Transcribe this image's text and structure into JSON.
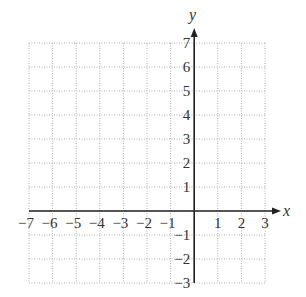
{
  "chart_data": {
    "type": "scatter",
    "title": "",
    "xlabel": "x",
    "ylabel": "y",
    "xlim": [
      -7,
      3
    ],
    "ylim": [
      -3,
      7
    ],
    "grid": true,
    "grid_style": "dotted",
    "x_ticks": [
      -7,
      -6,
      -5,
      -4,
      -3,
      -2,
      -1,
      1,
      2,
      3
    ],
    "y_ticks": [
      -3,
      -2,
      -1,
      1,
      2,
      3,
      4,
      5,
      6,
      7
    ],
    "x_tick_labels": [
      "−7",
      "−6",
      "−5",
      "−4",
      "−3",
      "−2",
      "−1",
      "1",
      "2",
      "3"
    ],
    "y_tick_labels": [
      "−3",
      "−2",
      "−1",
      "1",
      "2",
      "3",
      "4",
      "5",
      "6",
      "7"
    ],
    "series": [],
    "legend": null
  },
  "colors": {
    "grid": "#b0b0b0",
    "axis": "#222222",
    "text": "#333333",
    "background": "#ffffff"
  },
  "layout": {
    "x0": 29,
    "x1": 265,
    "y0": 43,
    "y1": 283
  }
}
